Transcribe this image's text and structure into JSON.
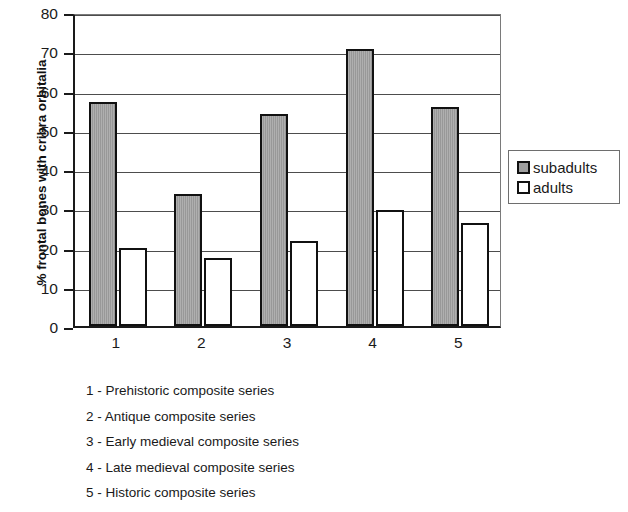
{
  "chart_data": {
    "type": "bar",
    "title": "",
    "subtitle": "",
    "xlabel": "",
    "ylabel": "% frontal bones with cribra orbitalia",
    "categories": [
      "1",
      "2",
      "3",
      "4",
      "5"
    ],
    "series": [
      {
        "name": "subadults",
        "color": "#a0a0a0",
        "values": [
          57.2,
          33.6,
          54.0,
          70.6,
          55.8
        ]
      },
      {
        "name": "adults",
        "color": "#ffffff",
        "values": [
          19.8,
          17.4,
          21.6,
          29.6,
          26.2
        ]
      }
    ],
    "ylim": [
      0,
      80
    ],
    "ytick_labels": [
      "0",
      "10",
      "20",
      "30",
      "40",
      "50",
      "60",
      "70",
      "80"
    ],
    "ytick_values": [
      0,
      10,
      20,
      30,
      40,
      50,
      60,
      70,
      80
    ],
    "grid": "horizontal",
    "legend_position": "right"
  },
  "legend": {
    "entries": [
      {
        "label": "subadults",
        "swatch": "gray-filled-square"
      },
      {
        "label": "adults",
        "swatch": "white-square"
      }
    ]
  },
  "caption": {
    "lines": [
      "1 - Prehistoric composite series",
      "2 - Antique composite series",
      "3 - Early medieval composite series",
      "4 - Late medieval composite series",
      "5 - Historic composite series"
    ]
  },
  "colors": {
    "subadults_fill": "#a0a0a0",
    "adults_fill": "#ffffff",
    "axis": "#1a1a1a",
    "gridline": "#4d4d4d",
    "background": "#ffffff"
  }
}
